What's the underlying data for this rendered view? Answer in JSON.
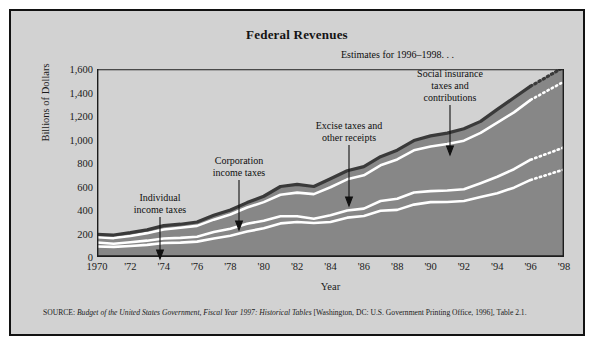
{
  "figure": {
    "title": "Federal Revenues",
    "background_color": "#d2d2d2",
    "border_color": "#121212",
    "area_fill_color": "#878787",
    "outline_color": "#3a3a3a",
    "divider_color": "#ffffff"
  },
  "axes": {
    "ylabel": "Billions of Dollars",
    "xlabel": "Year",
    "yticks": [
      "0",
      "200",
      "400",
      "600",
      "800",
      "1,000",
      "1,200",
      "1,400",
      "1,600"
    ],
    "ytick_values": [
      0,
      200,
      400,
      600,
      800,
      1000,
      1200,
      1400,
      1600
    ],
    "xticks": [
      "1970",
      "'72",
      "'74",
      "'76",
      "'78",
      "'80",
      "'82",
      "'84",
      "'86",
      "'88",
      "'90",
      "'92",
      "'94",
      "'96",
      "'98"
    ],
    "xtick_values": [
      1970,
      1972,
      1974,
      1976,
      1978,
      1980,
      1982,
      1984,
      1986,
      1988,
      1990,
      1992,
      1994,
      1996,
      1998
    ]
  },
  "annotations": {
    "individual": "Individual\nincome taxes",
    "corporation": "Corporation\nincome taxes",
    "excise": "Excise taxes and\nother receipts",
    "social": "Social insurance\ntaxes and\ncontributions",
    "estimates": "Estimates for 1996–1998. . ."
  },
  "source": {
    "prefix": "SOURCE: ",
    "italic": "Budget of the United States Government, Fiscal Year 1997: Historical Tables",
    "suffix": " [Washington, DC: U.S. Government Printing Office, 1996], Table 2.1."
  },
  "chart_data": {
    "type": "area",
    "title": "Federal Revenues",
    "xlabel": "Year",
    "ylabel": "Billions of Dollars",
    "xlim": [
      1970,
      1998
    ],
    "ylim": [
      0,
      1600
    ],
    "grid": false,
    "legend": "annotated in-plot",
    "stacked": true,
    "estimate_start_year": 1996,
    "x": [
      1970,
      1971,
      1972,
      1973,
      1974,
      1975,
      1976,
      1977,
      1978,
      1979,
      1980,
      1981,
      1982,
      1983,
      1984,
      1985,
      1986,
      1987,
      1988,
      1989,
      1990,
      1991,
      1992,
      1993,
      1994,
      1995,
      1996,
      1997,
      1998
    ],
    "series": [
      {
        "name": "Individual income taxes",
        "values": [
          90,
          86,
          94,
          103,
          119,
          122,
          131,
          157,
          181,
          217,
          244,
          286,
          298,
          289,
          298,
          335,
          349,
          393,
          401,
          446,
          467,
          468,
          476,
          510,
          543,
          590,
          656,
          700,
          745
        ]
      },
      {
        "name": "Corporation income taxes",
        "values": [
          33,
          27,
          32,
          36,
          39,
          41,
          42,
          55,
          60,
          66,
          65,
          61,
          49,
          37,
          57,
          61,
          63,
          84,
          95,
          103,
          94,
          98,
          100,
          118,
          140,
          157,
          172,
          180,
          188
        ]
      },
      {
        "name": "Social insurance taxes and contributions",
        "values": [
          45,
          48,
          53,
          64,
          76,
          86,
          92,
          106,
          121,
          138,
          158,
          183,
          201,
          209,
          239,
          265,
          283,
          303,
          334,
          359,
          380,
          396,
          414,
          428,
          461,
          484,
          509,
          535,
          560
        ]
      },
      {
        "name": "Excise taxes and other receipts",
        "values": [
          25,
          26,
          28,
          28,
          33,
          30,
          33,
          37,
          38,
          42,
          50,
          70,
          70,
          65,
          72,
          73,
          74,
          74,
          79,
          83,
          90,
          92,
          101,
          98,
          112,
          124,
          117,
          120,
          125
        ]
      }
    ],
    "totals": [
      193,
      187,
      207,
      231,
      267,
      279,
      298,
      355,
      400,
      463,
      517,
      600,
      618,
      600,
      666,
      734,
      769,
      854,
      909,
      991,
      1031,
      1054,
      1091,
      1154,
      1256,
      1355,
      1454,
      1535,
      1618
    ],
    "boundaries_1998": {
      "individual_top": 570,
      "corporation_top": 770,
      "social_top": 1000,
      "total_top": 1570
    }
  }
}
